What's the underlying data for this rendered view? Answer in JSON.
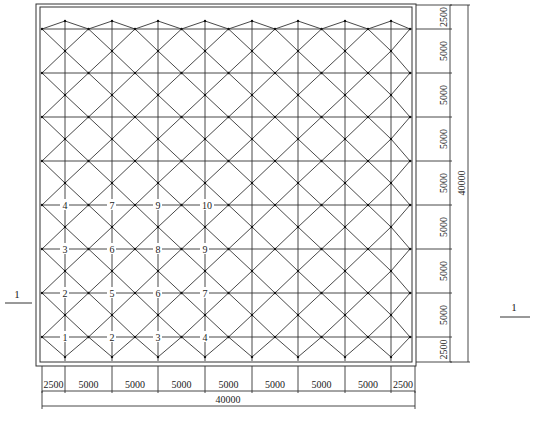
{
  "diagram": {
    "type": "structural-grid-plan",
    "overall_width_label": "40000",
    "overall_height_label": "40000",
    "bottom_dimensions": [
      "2500",
      "5000",
      "5000",
      "5000",
      "5000",
      "5000",
      "5000",
      "5000",
      "2500"
    ],
    "right_dimensions": [
      "2500",
      "5000",
      "5000",
      "5000",
      "5000",
      "5000",
      "5000",
      "5000",
      "2500"
    ],
    "section_marks": {
      "left": "1",
      "right": "1"
    },
    "node_labels": {
      "row1": [
        "4",
        "7",
        "9",
        "10"
      ],
      "row2": [
        "3",
        "6",
        "8",
        "9"
      ],
      "row3": [
        "2",
        "5",
        "6",
        "7"
      ],
      "row4": [
        "1",
        "2",
        "3",
        "4"
      ]
    },
    "colors": {
      "line": "#333333",
      "text": "#222222",
      "background": "#ffffff"
    }
  }
}
